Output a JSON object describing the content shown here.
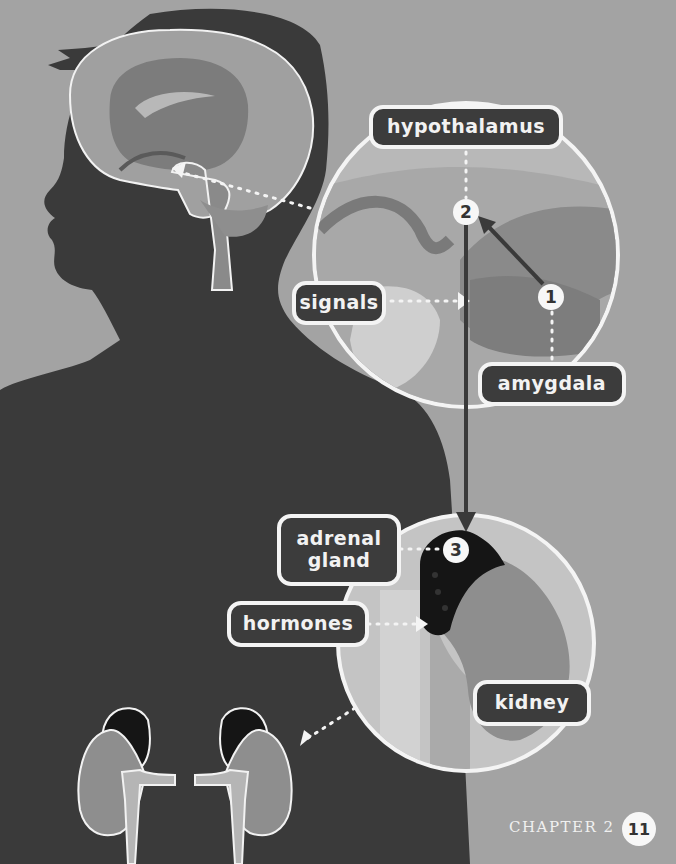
{
  "labels": {
    "hypothalamus": "hypothalamus",
    "signals": "signals",
    "amygdala": "amygdala",
    "adrenal_gland_line1": "adrenal",
    "adrenal_gland_line2": "gland",
    "hormones": "hormones",
    "kidney": "kidney"
  },
  "steps": {
    "step1": "1",
    "step2": "2",
    "step3": "3"
  },
  "footer": {
    "chapter": "CHAPTER 2",
    "page_number": "11"
  },
  "colors": {
    "background": "#a3a3a3",
    "silhouette": "#3a3a3a",
    "label_fill": "#3c3c3c",
    "label_border": "#f4f4f4",
    "kidney": "#8e8e8e",
    "adrenal": "#151515",
    "brain": "#9a9a9a",
    "arrow": "#3a3a3a"
  }
}
